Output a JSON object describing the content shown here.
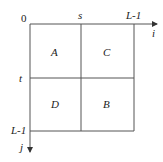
{
  "diagram": {
    "type": "image-partition",
    "origin_label": "0",
    "axes": {
      "horizontal": {
        "label": "i",
        "split_label": "s",
        "end_label": "L-1"
      },
      "vertical": {
        "label": "j",
        "split_label": "t",
        "end_label": "L-1"
      }
    },
    "quadrants": {
      "top_left": "A",
      "top_right": "C",
      "bottom_left": "D",
      "bottom_right": "B"
    },
    "colors": {
      "line": "#555555",
      "text": "#222222"
    }
  }
}
